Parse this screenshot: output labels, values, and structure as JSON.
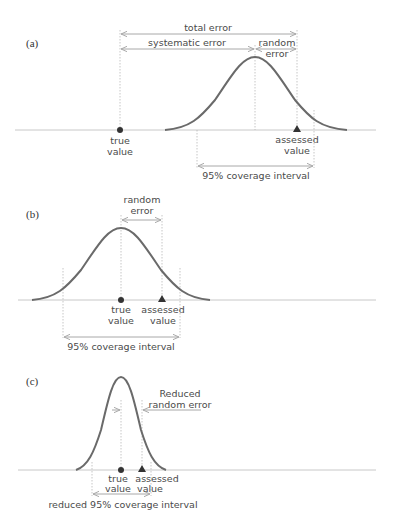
{
  "figure": {
    "type": "measurement-error-diagram",
    "colors": {
      "curve": "#6a6a6a",
      "baseline": "#c8c8c8",
      "arrows": "#a8a8a8",
      "guides": "#b8b8b8",
      "text": "#4a4a4a",
      "markers": "#333333"
    },
    "panels": [
      {
        "id": "a",
        "label": "(a)",
        "true_value_label": [
          "true",
          "value"
        ],
        "assessed_value_label": [
          "assessed",
          "value"
        ],
        "total_error_label": "total error",
        "systematic_error_label": "systematic error",
        "random_error_label": [
          "random",
          "error"
        ],
        "interval_label": "95% coverage interval"
      },
      {
        "id": "b",
        "label": "(b)",
        "true_value_label": [
          "true",
          "value"
        ],
        "assessed_value_label": [
          "assessed",
          "value"
        ],
        "random_error_label": [
          "random",
          "error"
        ],
        "interval_label": "95% coverage interval"
      },
      {
        "id": "c",
        "label": "(c)",
        "true_value_label": [
          "true",
          "value"
        ],
        "assessed_value_label": [
          "assessed",
          "value"
        ],
        "random_error_label": [
          "Reduced",
          "random error"
        ],
        "interval_label": "reduced 95% coverage interval"
      }
    ]
  }
}
